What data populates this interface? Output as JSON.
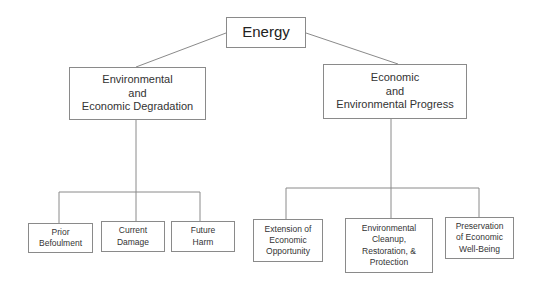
{
  "diagram": {
    "type": "tree",
    "root": {
      "label": "Energy"
    },
    "branches": [
      {
        "label": "Environmental\nand\nEconomic Degradation",
        "children": [
          {
            "label": "Prior\nBefoulment"
          },
          {
            "label": "Current\nDamage"
          },
          {
            "label": "Future\nHarm"
          }
        ]
      },
      {
        "label": "Economic\nand\nEnvironmental Progress",
        "children": [
          {
            "label": "Extension of\nEconomic\nOpportunity"
          },
          {
            "label": "Environmental\nCleanup,\nRestoration, &\nProtection"
          },
          {
            "label": "Preservation\nof Economic\nWell-Being"
          }
        ]
      }
    ],
    "colors": {
      "line": "#8a8a8a",
      "border": "#8a8a8a",
      "text": "#333333",
      "background": "#ffffff"
    }
  }
}
